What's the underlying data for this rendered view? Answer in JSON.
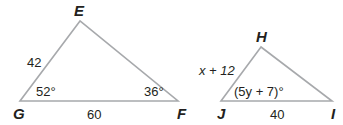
{
  "diagram": {
    "stroke_color": "#a7a9ac",
    "text_color": "#231f20",
    "triangles": [
      {
        "name": "EGF",
        "vertices": {
          "E": {
            "label": "E"
          },
          "G": {
            "label": "G"
          },
          "F": {
            "label": "F"
          }
        },
        "sides": {
          "EG": "42",
          "GF": "60"
        },
        "angles": {
          "G": "52°",
          "F": "36°"
        }
      },
      {
        "name": "HJI",
        "vertices": {
          "H": {
            "label": "H"
          },
          "J": {
            "label": "J"
          },
          "I": {
            "label": "I"
          }
        },
        "sides": {
          "HJ": "x + 12",
          "JI": "40"
        },
        "angles": {
          "J": "(5y + 7)°"
        }
      }
    ]
  }
}
